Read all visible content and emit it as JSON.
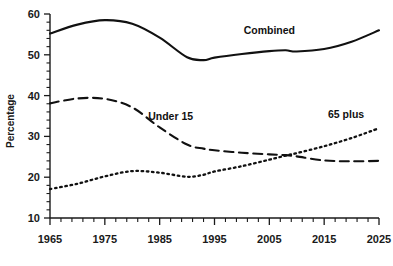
{
  "chart_data": {
    "type": "line",
    "title": "",
    "subtitle": "",
    "xlabel": "",
    "ylabel": "Percentage",
    "xlim": [
      1965,
      2025
    ],
    "ylim": [
      10,
      60
    ],
    "grid": false,
    "legend_position": "inline-annotations",
    "x_ticks": [
      "1965",
      "1975",
      "1985",
      "1995",
      "2005",
      "2015",
      "2025"
    ],
    "x_tick_values": [
      1965,
      1975,
      1985,
      1995,
      2005,
      2015,
      2025
    ],
    "x_minor_tick_interval": 2,
    "y_ticks": [
      "10",
      "20",
      "30",
      "40",
      "50",
      "60"
    ],
    "y_tick_values": [
      10,
      20,
      30,
      40,
      50,
      60
    ],
    "x": [
      1965,
      1970,
      1975,
      1980,
      1985,
      1990,
      1993,
      1995,
      2000,
      2005,
      2008,
      2010,
      2015,
      2020,
      2025
    ],
    "series": [
      {
        "name": "Combined",
        "style": "solid",
        "label_x": 2005,
        "label_y": 55,
        "values": [
          55.2,
          57.4,
          58.5,
          57.6,
          54.2,
          49.4,
          48.7,
          49.3,
          50.2,
          50.9,
          51.1,
          50.8,
          51.4,
          53.2,
          56.0
        ]
      },
      {
        "name": "Under 15",
        "style": "dashed",
        "label_x": 1987,
        "label_y": 34,
        "values": [
          38.1,
          39.3,
          39.2,
          37.1,
          32.2,
          28.0,
          27.0,
          26.6,
          26.0,
          25.6,
          25.4,
          25.1,
          24.1,
          23.9,
          24.0
        ]
      },
      {
        "name": "65 plus",
        "style": "dotted",
        "label_x": 2019,
        "label_y": 34.5,
        "values": [
          17.1,
          18.4,
          20.2,
          21.5,
          21.1,
          20.1,
          20.6,
          21.4,
          22.7,
          24.3,
          25.3,
          25.9,
          27.6,
          29.6,
          32.0
        ]
      }
    ],
    "annotations": [
      {
        "text": "Combined",
        "series": "Combined"
      },
      {
        "text": "Under 15",
        "series": "Under 15"
      },
      {
        "text": "65 plus",
        "series": "65 plus"
      }
    ]
  }
}
